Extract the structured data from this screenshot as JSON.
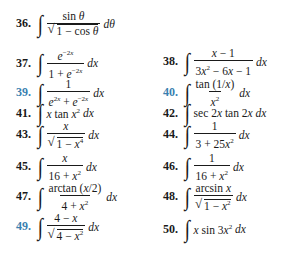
{
  "problems": [
    {
      "num": "36.",
      "color": "black",
      "numerator": "sin θ",
      "denominator": "√(1 − cos θ)",
      "differential": "dθ"
    },
    {
      "num": "37.",
      "color": "black",
      "numerator": "e^(−2x)",
      "denominator": "1 + e^(−2x)",
      "differential": "dx"
    },
    {
      "num": "38.",
      "color": "black",
      "numerator": "x − 1",
      "denominator": "3x² − 6x − 1",
      "differential": "dx"
    },
    {
      "num": "39.",
      "color": "blue",
      "numerator": "1",
      "denominator": "e^(2x) + e^(−2x)",
      "differential": "dx"
    },
    {
      "num": "40.",
      "color": "blue",
      "numerator": "tan (1/x)",
      "denominator": "x²",
      "differential": "dx"
    },
    {
      "num": "41.",
      "color": "black",
      "integrand": "x tan x²",
      "differential": "dx"
    },
    {
      "num": "42.",
      "color": "black",
      "integrand": "sec 2x tan 2x",
      "differential": "dx"
    },
    {
      "num": "43.",
      "color": "black",
      "numerator": "x",
      "denominator": "√(1 − x⁴)",
      "differential": "dx"
    },
    {
      "num": "44.",
      "color": "black",
      "numerator": "1",
      "denominator": "3 + 25x²",
      "differential": "dx"
    },
    {
      "num": "45.",
      "color": "black",
      "numerator": "x",
      "denominator": "16 + x²",
      "differential": "dx"
    },
    {
      "num": "46.",
      "color": "black",
      "numerator": "1",
      "denominator": "16 + x²",
      "differential": "dx"
    },
    {
      "num": "47.",
      "color": "black",
      "numerator": "arctan (x/2)",
      "denominator": "4 + x²",
      "differential": "dx"
    },
    {
      "num": "48.",
      "color": "black",
      "numerator": "arcsin x",
      "denominator": "√(1 − x²)",
      "differential": "dx"
    },
    {
      "num": "49.",
      "color": "blue",
      "numerator": "4 − x",
      "denominator": "√(4 − x²)",
      "differential": "dx"
    },
    {
      "num": "50.",
      "color": "black",
      "integrand": "x sin 3x²",
      "differential": "dx"
    }
  ],
  "colors": {
    "number_blue": "#3a7fb0",
    "text": "#1a1a1a",
    "background": "#ffffff"
  }
}
